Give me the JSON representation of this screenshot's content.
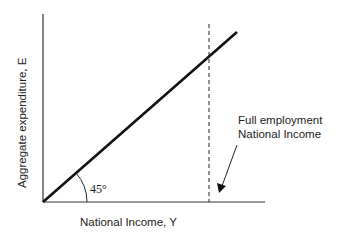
{
  "diagram": {
    "type": "45-degree line diagram (Keynesian cross)",
    "y_axis_label": "Aggregate expenditure, E",
    "x_axis_label": "National Income, Y",
    "angle_label": "45°",
    "annotation_line1": "Full employment",
    "annotation_line2": "National Income",
    "elements": [
      {
        "kind": "line",
        "name": "45-degree line",
        "from": [
          0,
          0
        ],
        "slope_deg": 45
      },
      {
        "kind": "dashed-vertical",
        "name": "full employment national income"
      },
      {
        "kind": "arrow",
        "points_to": "full employment national income"
      }
    ]
  }
}
